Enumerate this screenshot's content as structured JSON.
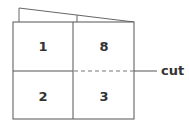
{
  "diagram": {
    "panels": [
      {
        "id": "top-left",
        "label": "1"
      },
      {
        "id": "top-right",
        "label": "8"
      },
      {
        "id": "bottom-left",
        "label": "2"
      },
      {
        "id": "bottom-right",
        "label": "3"
      }
    ],
    "cut_label": "cut",
    "colors": {
      "stroke": "#555555",
      "text": "#333333"
    }
  }
}
